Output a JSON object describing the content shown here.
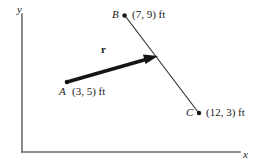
{
  "figure": {
    "type": "vector-diagram",
    "axes": {
      "x_label": "x",
      "y_label": "y"
    },
    "points": [
      {
        "name": "A",
        "coord_text": "(3, 5) ft",
        "x": 3,
        "y": 5,
        "units": "ft"
      },
      {
        "name": "B",
        "coord_text": "(7, 9) ft",
        "x": 7,
        "y": 9,
        "units": "ft"
      },
      {
        "name": "C",
        "coord_text": "(12, 3) ft",
        "x": 12,
        "y": 3,
        "units": "ft"
      }
    ],
    "vector": {
      "label": "r",
      "from": "A",
      "toward": "line BC"
    },
    "colors": {
      "ink": "#1a1a1a",
      "axis": "#6b6b6b",
      "background": "#ffffff"
    }
  }
}
